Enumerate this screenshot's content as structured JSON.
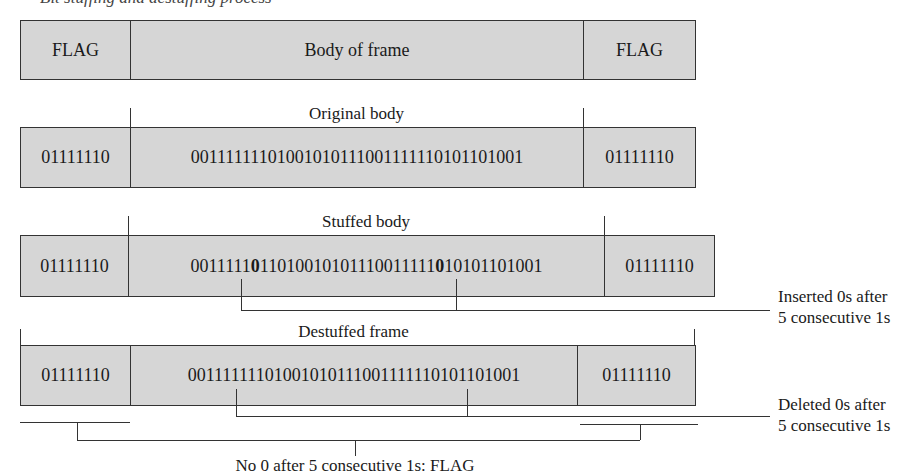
{
  "caption": "Bit stuffing and destuffing process",
  "rows": {
    "generic": {
      "left_flag": "FLAG",
      "body": "Body of frame",
      "right_flag": "FLAG"
    },
    "original": {
      "label": "Original body",
      "left_flag": "01111110",
      "body": "00111111101001010111001111110101101001",
      "right_flag": "01111110"
    },
    "stuffed": {
      "label": "Stuffed body",
      "left_flag": "01111110",
      "body_parts": [
        "0011111",
        "0",
        "11010010101110011111",
        "0",
        "10101101001"
      ],
      "right_flag": "01111110"
    },
    "destuffed": {
      "label": "Destuffed frame",
      "left_flag": "01111110",
      "body": "00111111101001010111001111110101101001",
      "right_flag": "01111110"
    }
  },
  "annotations": {
    "inserted_line1": "Inserted 0s after",
    "inserted_line2": "5 consecutive 1s",
    "deleted_line1": "Deleted 0s after",
    "deleted_line2": "5 consecutive 1s",
    "flag_note": "No 0 after 5 consecutive 1s: FLAG"
  }
}
